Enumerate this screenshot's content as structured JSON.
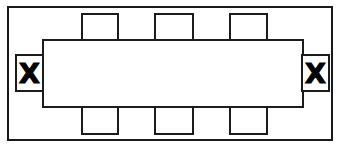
{
  "diagram": {
    "kind": "floor-plan",
    "stroke_color": "#1c1c1c",
    "fill_color": "#ffffff",
    "room": {
      "label": "",
      "x": 7,
      "y": 6,
      "width": 326,
      "height": 135
    },
    "table": {
      "label": "",
      "x": 42,
      "y": 39,
      "width": 262,
      "height": 69
    },
    "chairs_top": [
      {
        "label": "",
        "x": 81,
        "y": 13,
        "width": 38,
        "height": 27
      },
      {
        "label": "",
        "x": 154,
        "y": 13,
        "width": 40,
        "height": 27
      },
      {
        "label": "",
        "x": 229,
        "y": 13,
        "width": 39,
        "height": 27
      }
    ],
    "chairs_bottom": [
      {
        "label": "",
        "x": 81,
        "y": 107,
        "width": 38,
        "height": 28
      },
      {
        "label": "",
        "x": 154,
        "y": 107,
        "width": 40,
        "height": 28
      },
      {
        "label": "",
        "x": 229,
        "y": 107,
        "width": 39,
        "height": 28
      }
    ],
    "end_seats": [
      {
        "mark": "X",
        "side": "left",
        "x": 15,
        "y": 54,
        "width": 29,
        "height": 38
      },
      {
        "mark": "X",
        "side": "right",
        "x": 301,
        "y": 54,
        "width": 29,
        "height": 38
      }
    ]
  }
}
